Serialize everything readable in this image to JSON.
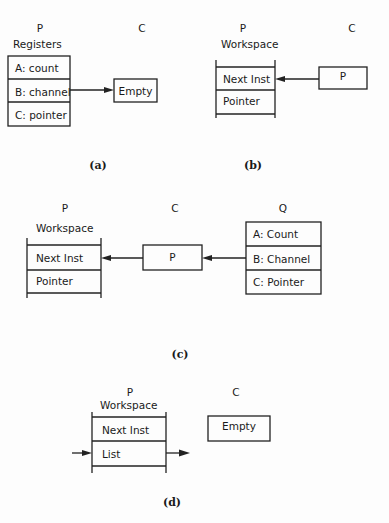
{
  "panels": {
    "a": {
      "caption": "(a)",
      "process_p_label": "P",
      "process_c_label": "C",
      "p_structure_title": "Registers",
      "p_rows": [
        "A: count",
        "B: channel",
        "C: pointer"
      ],
      "c_box_value": "Empty",
      "arrow": "B: channel -> Empty"
    },
    "b": {
      "caption": "(b)",
      "process_p_label": "P",
      "process_c_label": "C",
      "p_structure_title": "Workspace",
      "p_rows": [
        "Next Inst",
        "Pointer"
      ],
      "c_box_value": "P",
      "arrow": "P -> Next Inst"
    },
    "c": {
      "caption": "(c)",
      "process_p_label": "P",
      "process_c_label": "C",
      "process_q_label": "Q",
      "p_structure_title": "Workspace",
      "p_rows": [
        "Next Inst",
        "Pointer"
      ],
      "c_box_value": "P",
      "q_rows": [
        "A: Count",
        "B: Channel",
        "C: Pointer"
      ],
      "arrows": [
        "B: Channel -> C box",
        "C box -> Next Inst"
      ]
    },
    "d": {
      "caption": "(d)",
      "process_p_label": "P",
      "process_c_label": "C",
      "p_structure_title": "Workspace",
      "p_rows": [
        "Next Inst",
        "List"
      ],
      "c_box_value": "Empty",
      "arrows": [
        "incoming -> List",
        "List -> outgoing"
      ]
    }
  }
}
